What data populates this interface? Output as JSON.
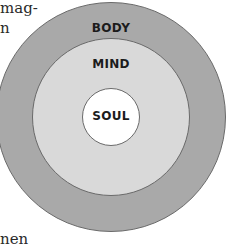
{
  "text_fragments": {
    "top_line_1": "mag-",
    "top_line_2": "n",
    "bottom_line": "nen"
  },
  "diagram": {
    "type": "concentric-circles",
    "layers": [
      {
        "label": "BODY",
        "position": "outer",
        "color": "#a9a9a9"
      },
      {
        "label": "MIND",
        "position": "middle",
        "color": "#d9d9d9"
      },
      {
        "label": "SOUL",
        "position": "inner",
        "color": "#ffffff"
      }
    ],
    "outline_color": "#6a6a6a"
  }
}
